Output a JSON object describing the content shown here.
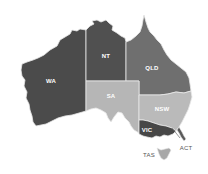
{
  "map": {
    "title": "Australia states and territories",
    "regions": [
      {
        "id": "WA",
        "label": "WA",
        "color": "#4b4b4b"
      },
      {
        "id": "NT",
        "label": "NT",
        "color": "#505050"
      },
      {
        "id": "QLD",
        "label": "QLD",
        "color": "#6f6f6f"
      },
      {
        "id": "SA",
        "label": "SA",
        "color": "#b6b6b6"
      },
      {
        "id": "NSW",
        "label": "NSW",
        "color": "#bababa"
      },
      {
        "id": "VIC",
        "label": "VIC",
        "color": "#474747"
      },
      {
        "id": "TAS",
        "label": "TAS",
        "color": "#a8a8a8"
      },
      {
        "id": "ACT",
        "label": "ACT",
        "color": "#5a5a5a"
      }
    ],
    "border_color": "#e8e8e8"
  }
}
